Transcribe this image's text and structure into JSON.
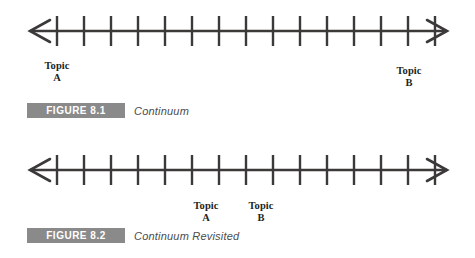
{
  "page": {
    "background_color": "#ffffff",
    "ink_color": "#3b3a39",
    "badge_color": "#8a8a8a",
    "badge_text_color": "#ffffff",
    "caption_text_color": "#4c4c4c"
  },
  "figures": [
    {
      "id": "figure-8-1",
      "badge_label": "FIGURE 8.1",
      "caption": "Continuum",
      "diagram": {
        "type": "continuum-number-line",
        "tick_count": 15,
        "axis_start_x": 30,
        "axis_end_x": 447,
        "first_tick_x": 57,
        "tick_spacing": 27,
        "axis_y": 31,
        "tick_half_height": 15,
        "arrows": "both",
        "labels": [
          {
            "name": "topic-a",
            "line1": "Topic",
            "line2": "A",
            "center_x": 57,
            "top": 60
          },
          {
            "name": "topic-b",
            "line1": "Topic",
            "line2": "B",
            "center_x": 409,
            "top": 65
          }
        ]
      }
    },
    {
      "id": "figure-8-2",
      "badge_label": "FIGURE 8.2",
      "caption": "Continuum Revisited",
      "diagram": {
        "type": "continuum-number-line",
        "tick_count": 15,
        "axis_start_x": 30,
        "axis_end_x": 447,
        "first_tick_x": 57,
        "tick_spacing": 27,
        "axis_y": 40,
        "tick_half_height": 15,
        "arrows": "both",
        "labels": [
          {
            "name": "topic-a",
            "line1": "Topic",
            "line2": "A",
            "center_x": 206,
            "top": 70
          },
          {
            "name": "topic-b",
            "line1": "Topic",
            "line2": "B",
            "center_x": 261,
            "top": 70
          }
        ]
      }
    }
  ]
}
